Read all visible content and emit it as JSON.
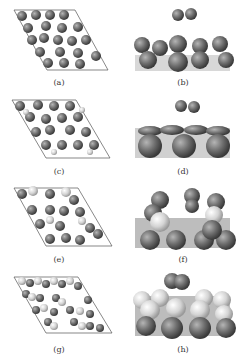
{
  "figure": {
    "panels": [
      {
        "id": "a",
        "label": "(a)",
        "view": "top",
        "description": "Top view of slab supercell with dark spheres"
      },
      {
        "id": "b",
        "label": "(b)",
        "view": "side",
        "description": "Side view: diatomic molecule above surface"
      },
      {
        "id": "c",
        "label": "(c)",
        "view": "top",
        "description": "Top view of slab supercell, dark spheres with light atoms"
      },
      {
        "id": "d",
        "label": "(d)",
        "view": "side",
        "description": "Side view: diatomic molecule above flat surface"
      },
      {
        "id": "e",
        "label": "(e)",
        "view": "top",
        "description": "Top view with mixed dark and light atoms"
      },
      {
        "id": "f",
        "label": "(f)",
        "view": "side",
        "description": "Side view: reconstructed surface with adsorbate"
      },
      {
        "id": "g",
        "label": "(g)",
        "view": "top",
        "description": "Top view with alternating light and dark atoms"
      },
      {
        "id": "h",
        "label": "(h)",
        "view": "side",
        "description": "Side view: molecule bonded on light atom surface"
      }
    ],
    "colors": {
      "dark_atom": "#6e6e6e",
      "light_atom": "#d8d8d8",
      "cell_line": "#555555"
    }
  }
}
